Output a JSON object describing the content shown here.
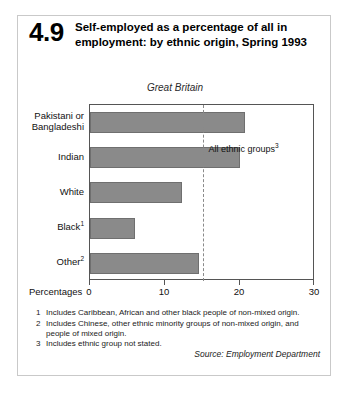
{
  "figure": {
    "number": "4.9",
    "title": "Self-employed as a percentage of all in employment: by ethnic origin, Spring 1993",
    "subtitle": "Great Britain",
    "source": "Source: Employment Department"
  },
  "axis": {
    "title": "Percentages",
    "ticks": [
      "0",
      "10",
      "20",
      "30"
    ]
  },
  "annotation": {
    "ref_label": "All ethnic groups",
    "ref_sup": "3"
  },
  "footnotes": [
    {
      "marker": "1",
      "text": "Includes Caribbean, African and other black people of non-mixed origin."
    },
    {
      "marker": "2",
      "text": "Includes Chinese, other ethnic minority groups of non-mixed origin, and people of mixed origin."
    },
    {
      "marker": "3",
      "text": "Includes ethnic group not stated."
    }
  ],
  "colors": {
    "bar_fill": "#8a8a8a",
    "bar_stroke": "#6f6f6f",
    "axis": "#555555",
    "ref_line": "#8a8a8a",
    "card_border": "#c9c9c9"
  },
  "chart_data": {
    "type": "bar",
    "orientation": "horizontal",
    "title": "Self-employed as a percentage of all in employment: by ethnic origin, Spring 1993",
    "subtitle": "Great Britain",
    "xlabel": "Percentages",
    "ylabel": "",
    "xlim": [
      0,
      30
    ],
    "xticks": [
      0,
      10,
      20,
      30
    ],
    "grid": false,
    "legend": false,
    "categories": [
      "Pakistani or Bangladeshi",
      "Indian",
      "White",
      "Black",
      "Other"
    ],
    "category_superscripts": [
      "",
      "",
      "",
      "1",
      "2"
    ],
    "values": [
      20.7,
      20.0,
      12.3,
      6.0,
      14.5
    ],
    "reference_line": {
      "label": "All ethnic groups",
      "superscript": "3",
      "value": 15.0,
      "style": "dashed"
    }
  }
}
